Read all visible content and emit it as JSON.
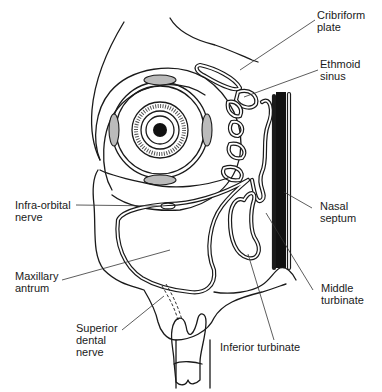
{
  "figure": {
    "colors": {
      "line": "#1a1a1a",
      "background": "#ffffff",
      "septum": "#111111"
    }
  },
  "labels": {
    "cribriform_plate": "Cribriform\nplate",
    "ethmoid_sinus": "Ethmoid\nsinus",
    "nasal_septum": "Nasal\nseptum",
    "middle_turbinate": "Middle\nturbinate",
    "inferior_turbinate": "Inferior turbinate",
    "infra_orbital_nerve": "Infra-orbital\nnerve",
    "maxillary_antrum": "Maxillary\nantrum",
    "superior_dental_nerve": "Superior\ndental\nnerve"
  }
}
